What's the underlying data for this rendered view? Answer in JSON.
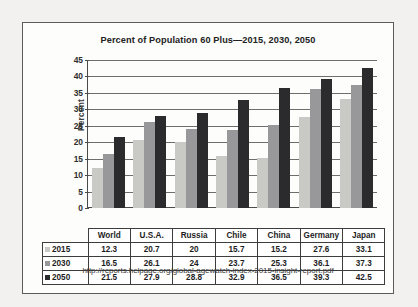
{
  "chart_data": {
    "type": "bar",
    "title": "Percent of Population 60 Plus—2015, 2030, 2050",
    "xlabel": "",
    "ylabel": "Percent",
    "ylim": [
      0,
      45
    ],
    "ytick_step": 5,
    "yticks": [
      45,
      40,
      35,
      30,
      25,
      20,
      15,
      10,
      5,
      0
    ],
    "grid": true,
    "legend_position": "table-left-column",
    "categories": [
      "World",
      "U.S.A.",
      "Russia",
      "Chile",
      "China",
      "Germany",
      "Japan"
    ],
    "series": [
      {
        "name": "2015",
        "color": "#c9c9c6",
        "values": [
          12.3,
          20.7,
          20,
          15.7,
          15.2,
          27.6,
          33.1
        ]
      },
      {
        "name": "2030",
        "color": "#98989a",
        "values": [
          16.5,
          26.1,
          24,
          23.7,
          25.3,
          36.1,
          37.3
        ]
      },
      {
        "name": "2050",
        "color": "#2b2b2e",
        "values": [
          21.5,
          27.9,
          28.8,
          32.9,
          36.5,
          39.3,
          42.5
        ]
      }
    ],
    "table": {
      "header": [
        "",
        "World",
        "U.S.A.",
        "Russia",
        "Chile",
        "China",
        "Germany",
        "Japan"
      ],
      "rows": [
        {
          "label": "2015",
          "values": [
            "12.3",
            "20.7",
            "20",
            "15.7",
            "15.2",
            "27.6",
            "33.1"
          ]
        },
        {
          "label": "2030",
          "values": [
            "16.5",
            "26.1",
            "24",
            "23.7",
            "25.3",
            "36.1",
            "37.3"
          ]
        },
        {
          "label": "2050",
          "values": [
            "21.5",
            "27.9",
            "28.8",
            "32.9",
            "36.5",
            "39.3",
            "42.5"
          ]
        }
      ]
    },
    "annotations": {
      "source_url": "http://reports.helpage.org/global-agewatch-index-2015-insight-report.pdf"
    }
  }
}
